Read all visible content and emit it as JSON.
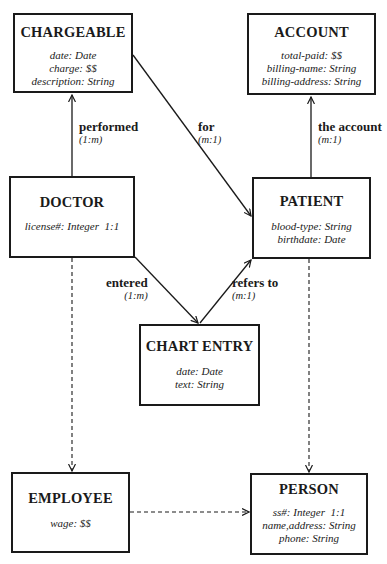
{
  "entities": {
    "chargeable": {
      "title": "CHARGEABLE",
      "attributes": [
        "date: Date",
        "charge: $$",
        "description: String"
      ]
    },
    "account": {
      "title": "ACCOUNT",
      "attributes": [
        "total-paid: $$",
        "billing-name: String",
        "billing-address: String"
      ]
    },
    "doctor": {
      "title": "DOCTOR",
      "attributes": [
        "license#: Integer  1:1"
      ]
    },
    "patient": {
      "title": "PATIENT",
      "attributes": [
        "blood-type: String",
        "birthdate: Date"
      ]
    },
    "chart_entry": {
      "title": "CHART ENTRY",
      "attributes": [
        "date: Date",
        "text: String"
      ]
    },
    "employee": {
      "title": "EMPLOYEE",
      "attributes": [
        "wage: $$"
      ]
    },
    "person": {
      "title": "PERSON",
      "attributes": [
        "ss#: Integer  1:1",
        "name,address: String",
        "phone: String"
      ]
    }
  },
  "relationships": {
    "performed": {
      "name": "performed",
      "cardinality": "(1:m)",
      "from": "DOCTOR",
      "to": "CHARGEABLE"
    },
    "for": {
      "name": "for",
      "cardinality": "(m:1)",
      "from": "CHARGEABLE",
      "to": "PATIENT"
    },
    "the_account": {
      "name": "the account",
      "cardinality": "(m:1)",
      "from": "PATIENT",
      "to": "ACCOUNT"
    },
    "entered": {
      "name": "entered",
      "cardinality": "(1:m)",
      "from": "DOCTOR",
      "to": "CHART ENTRY"
    },
    "refers_to": {
      "name": "refers to",
      "cardinality": "(m:1)",
      "from": "CHART ENTRY",
      "to": "PATIENT"
    }
  },
  "inheritance": [
    {
      "from": "DOCTOR",
      "to": "EMPLOYEE",
      "style": "dashed"
    },
    {
      "from": "PATIENT",
      "to": "PERSON",
      "style": "dashed"
    },
    {
      "from": "EMPLOYEE",
      "to": "PERSON",
      "style": "dashed"
    }
  ],
  "colors": {
    "ink": "#1a1a1a",
    "background": "#ffffff"
  }
}
